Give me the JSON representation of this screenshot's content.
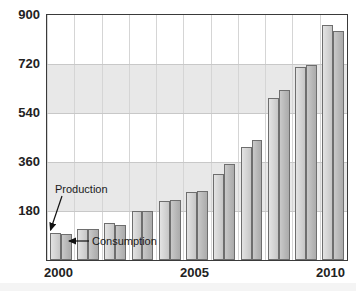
{
  "chart_data": {
    "type": "bar",
    "title": "",
    "xlabel": "",
    "ylabel": "",
    "categories": [
      "2000",
      "2001",
      "2002",
      "2003",
      "2004",
      "2005",
      "2006",
      "2007",
      "2008",
      "2009",
      "2010"
    ],
    "series": [
      {
        "name": "Production",
        "values": [
          100,
          115,
          135,
          180,
          215,
          250,
          315,
          415,
          595,
          710,
          865
        ]
      },
      {
        "name": "Consumption",
        "values": [
          95,
          113,
          128,
          180,
          222,
          255,
          353,
          440,
          625,
          718,
          840
        ]
      }
    ],
    "ylim": [
      0,
      900
    ],
    "yticks": [
      180,
      360,
      540,
      720,
      900
    ],
    "ytick_labels": [
      "180",
      "360",
      "540",
      "720",
      "900"
    ],
    "xticks": [
      "2000",
      "2005",
      "2010"
    ],
    "grid": true,
    "legend": "none",
    "annotations": [
      {
        "label": "Production",
        "points_to": "2000-production-bar"
      },
      {
        "label": "Consumption",
        "points_to": "2000-consumption-bar"
      }
    ],
    "colors": {
      "production_bar": "#d2d2d2",
      "consumption_bar": "#b6b6b6",
      "bar_outline": "#6e6e6e",
      "band": "#e8e8e8",
      "gridline": "#c8c8c8",
      "frame": "#3a3a3a",
      "text": "#222222"
    }
  }
}
